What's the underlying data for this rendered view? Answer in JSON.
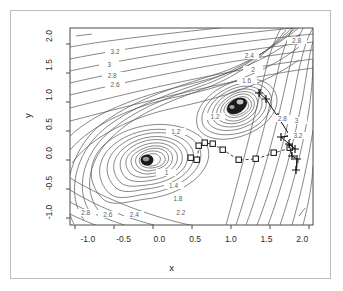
{
  "figure": {
    "background": "#ffffff",
    "frame_color": "#bdbdbd",
    "axis_color": "#2b2b2b",
    "contour_color": "#555555",
    "path_color": "#000000"
  },
  "chart_data": {
    "type": "line",
    "title": "",
    "subtitle": "",
    "xlabel": "x",
    "ylabel": "y",
    "xlim": [
      -1.25,
      2.15
    ],
    "ylim": [
      -1.2,
      2.15
    ],
    "grid": false,
    "legend": "none",
    "xticks": [
      "-1.0",
      "-0.5",
      "0.0",
      "0.5",
      "1.0",
      "1.5",
      "2.0"
    ],
    "xtick_values": [
      -1.0,
      -0.5,
      0.0,
      0.5,
      1.0,
      1.5,
      2.0
    ],
    "yticks": [
      "-1.0",
      "-0.5",
      "0.0",
      "0.5",
      "1.0",
      "1.5",
      "2.0"
    ],
    "ytick_values": [
      -1.0,
      -0.5,
      0.0,
      0.5,
      1.0,
      1.5,
      2.0
    ],
    "contour_levels": [
      0.2,
      0.4,
      0.6,
      0.8,
      1.0,
      1.2,
      1.4,
      1.6,
      1.8,
      2.0,
      2.2,
      2.4,
      2.6,
      2.8,
      3.0,
      3.2
    ],
    "contour_labels": [
      {
        "text": "3.2",
        "x": -0.62,
        "y": 1.72
      },
      {
        "text": "3",
        "x": -0.7,
        "y": 1.5
      },
      {
        "text": "2.8",
        "x": -0.66,
        "y": 1.32
      },
      {
        "text": "2.6",
        "x": -0.62,
        "y": 1.17
      },
      {
        "text": "2.4",
        "x": 1.26,
        "y": 1.66
      },
      {
        "text": "2",
        "x": 1.31,
        "y": 1.42
      },
      {
        "text": "1.6",
        "x": 1.22,
        "y": 1.24
      },
      {
        "text": "2.8",
        "x": 1.92,
        "y": 1.92
      },
      {
        "text": "2.8",
        "x": 1.72,
        "y": 0.58
      },
      {
        "text": "3",
        "x": 1.92,
        "y": 0.56
      },
      {
        "text": "3.2",
        "x": 1.94,
        "y": 0.3
      },
      {
        "text": "1.2",
        "x": 0.23,
        "y": 0.36
      },
      {
        "text": "1",
        "x": 0.1,
        "y": -0.33
      },
      {
        "text": "1.4",
        "x": 0.2,
        "y": -0.55
      },
      {
        "text": "1.8",
        "x": 0.26,
        "y": -0.77
      },
      {
        "text": "2.2",
        "x": 0.3,
        "y": -1.02
      },
      {
        "text": "2.4",
        "x": -0.35,
        "y": -1.05
      },
      {
        "text": "2.6",
        "x": -0.72,
        "y": -1.04
      },
      {
        "text": "2.8",
        "x": -1.03,
        "y": -1.02
      },
      {
        "text": "1.2",
        "x": 0.78,
        "y": 0.62
      }
    ],
    "minima": [
      {
        "label": "minimum-left",
        "x": 0.0,
        "y": 0.0
      },
      {
        "label": "minimum-right",
        "x": 1.0,
        "y": 1.0
      }
    ],
    "series": [
      {
        "name": "plus-path",
        "marker": "plus",
        "linestyle": "solid",
        "points": [
          [
            1.48,
            -0.14
          ],
          [
            1.5,
            0.02
          ],
          [
            1.43,
            0.06
          ],
          [
            1.39,
            0.22
          ],
          [
            1.46,
            0.16
          ],
          [
            1.26,
            0.33
          ],
          [
            1.39,
            0.34
          ],
          [
            1.23,
            0.61
          ],
          [
            1.06,
            0.86
          ],
          [
            0.97,
            0.94
          ],
          [
            1.0,
            1.0
          ]
        ]
      },
      {
        "name": "square-path",
        "marker": "square",
        "linestyle": "dashed",
        "points": [
          [
            1.4,
            0.18
          ],
          [
            1.18,
            0.1
          ],
          [
            0.93,
            -0.02
          ],
          [
            0.69,
            -0.04
          ],
          [
            0.47,
            0.1
          ],
          [
            0.33,
            0.19
          ],
          [
            0.22,
            0.21
          ],
          [
            0.14,
            0.17
          ],
          [
            0.12,
            -0.02
          ],
          [
            0.03,
            0.0
          ]
        ]
      }
    ]
  },
  "axes": {
    "x_title": "x",
    "y_title": "y"
  }
}
